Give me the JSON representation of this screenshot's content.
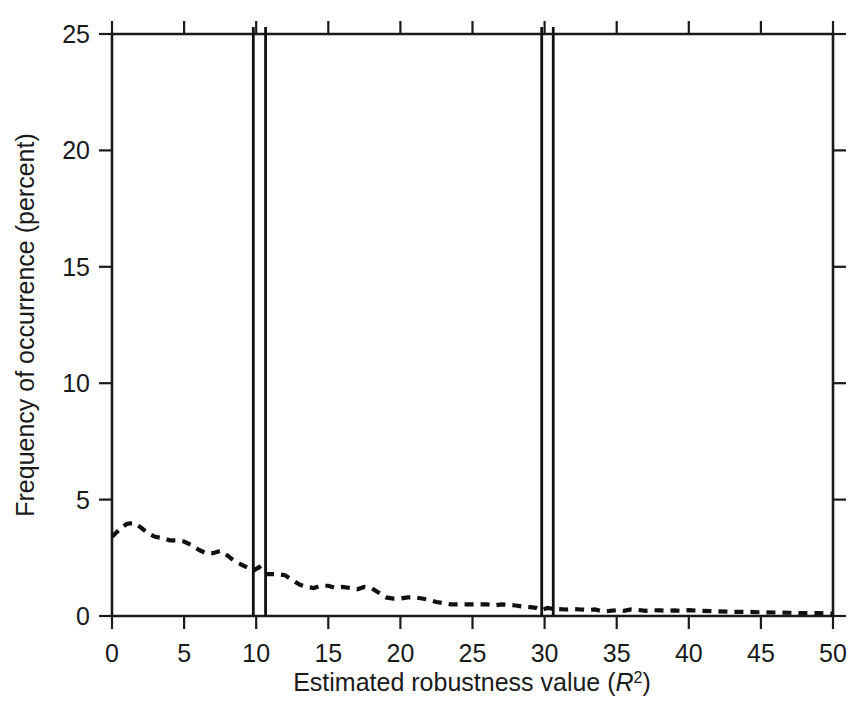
{
  "figure": {
    "background_color": "#ffffff",
    "ink_color": "#111111"
  },
  "chart_data": {
    "type": "line",
    "title": "",
    "subtitle": "",
    "xlabel": "Estimated robustness value (R2)",
    "xlabel_parts": {
      "prefix": "Estimated robustness value (",
      "italic_symbol": "R",
      "superscript": "2",
      "suffix": ")"
    },
    "ylabel": "Frequency of occurrence (percent)",
    "xlim": [
      0,
      50
    ],
    "ylim": [
      0,
      25
    ],
    "xticks": [
      0,
      5,
      10,
      15,
      20,
      25,
      30,
      35,
      40,
      45,
      50
    ],
    "xtick_labels": [
      "0",
      "5",
      "10",
      "15",
      "20",
      "25",
      "30",
      "35",
      "40",
      "45",
      "50"
    ],
    "yticks": [
      0,
      5,
      10,
      15,
      20,
      25
    ],
    "ytick_labels": [
      "0",
      "5",
      "10",
      "15",
      "20",
      "25"
    ],
    "grid": false,
    "legend": "none",
    "legend_position": "none",
    "series": [
      {
        "name": "frequency-distribution",
        "style": "dashed",
        "x": [
          0.0,
          0.5,
          1.0,
          1.5,
          2.0,
          2.5,
          3.0,
          3.5,
          4.0,
          4.5,
          5.0,
          5.5,
          6.0,
          6.5,
          7.0,
          7.5,
          8.0,
          8.5,
          9.0,
          9.5,
          9.8,
          10.2,
          10.6,
          11.0,
          11.5,
          12.0,
          12.5,
          13.0,
          13.5,
          14.0,
          14.5,
          15.0,
          15.5,
          16.0,
          16.5,
          17.0,
          17.5,
          18.0,
          18.5,
          19.0,
          19.5,
          20.0,
          20.5,
          21.0,
          21.5,
          22.0,
          22.5,
          23.0,
          23.5,
          24.0,
          24.5,
          25.0,
          25.5,
          26.0,
          26.5,
          27.0,
          27.5,
          28.0,
          28.5,
          29.0,
          29.4,
          29.8,
          30.2,
          30.6,
          31.0,
          31.5,
          32.0,
          32.5,
          33.0,
          33.5,
          34.0,
          34.5,
          35.0,
          35.5,
          36.0,
          36.5,
          37.0,
          37.5,
          38.0,
          38.5,
          39.0,
          39.5,
          40.0,
          41.0,
          42.0,
          43.0,
          44.0,
          45.0,
          46.0,
          47.0,
          48.0,
          49.0,
          50.0
        ],
        "y": [
          3.4,
          3.7,
          3.95,
          4.0,
          3.8,
          3.55,
          3.4,
          3.35,
          3.25,
          3.25,
          3.2,
          3.05,
          2.85,
          2.7,
          2.7,
          2.8,
          2.6,
          2.35,
          2.2,
          2.05,
          1.95,
          2.1,
          1.8,
          1.8,
          1.8,
          1.75,
          1.55,
          1.35,
          1.25,
          1.2,
          1.3,
          1.3,
          1.2,
          1.25,
          1.2,
          1.15,
          1.25,
          1.2,
          1.0,
          0.8,
          0.75,
          0.75,
          0.8,
          0.8,
          0.75,
          0.7,
          0.6,
          0.55,
          0.5,
          0.5,
          0.5,
          0.5,
          0.5,
          0.5,
          0.45,
          0.5,
          0.48,
          0.45,
          0.4,
          0.38,
          0.35,
          0.25,
          0.35,
          0.3,
          0.3,
          0.28,
          0.3,
          0.28,
          0.26,
          0.28,
          0.2,
          0.22,
          0.25,
          0.22,
          0.28,
          0.26,
          0.22,
          0.25,
          0.24,
          0.22,
          0.24,
          0.22,
          0.25,
          0.22,
          0.2,
          0.18,
          0.18,
          0.16,
          0.15,
          0.14,
          0.12,
          0.12,
          0.1
        ]
      }
    ],
    "vertical_reference_lines": [
      {
        "name": "threshold-line-1",
        "x": 9.8,
        "y_top": 25.0,
        "y_bottom": 0.0
      },
      {
        "name": "threshold-line-2",
        "x": 10.65,
        "y_top": 25.0,
        "y_bottom": 0.0
      },
      {
        "name": "threshold-line-3",
        "x": 29.8,
        "y_top": 25.0,
        "y_bottom": 0.0
      },
      {
        "name": "threshold-line-4",
        "x": 30.6,
        "y_top": 25.0,
        "y_bottom": 0.0
      }
    ],
    "annotations": []
  }
}
